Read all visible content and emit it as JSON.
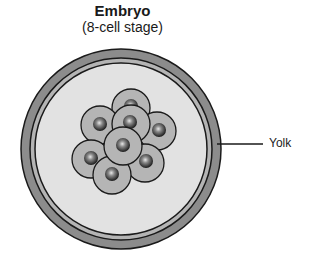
{
  "title": {
    "main": "Embryo",
    "sub": "(8-cell stage)"
  },
  "labels": {
    "yolk": "Yolk"
  },
  "colors": {
    "outer_ring": "#8c8c8c",
    "inner_ring": "#b4b4b4",
    "yolk_fill": "#e2e2e2",
    "cell_fill": "#b5b5b5",
    "outline": "#1a1a1a",
    "nucleus_dark": "#1e1e1e",
    "nucleus_light": "#cfcfcf"
  },
  "diagram": {
    "cell_count": 8
  }
}
